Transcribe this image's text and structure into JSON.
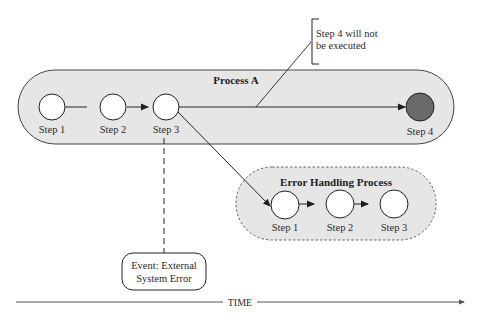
{
  "diagram": {
    "type": "process-flow",
    "colors": {
      "process_fill": "#e6e6e6",
      "process_stroke": "#444444",
      "step_fill": "#ffffff",
      "skipped_step_fill": "#6a6a6a",
      "line": "#222222"
    },
    "process_a": {
      "title": "Process A",
      "steps": [
        {
          "label": "Step 1"
        },
        {
          "label": "Step 2"
        },
        {
          "label": "Step 3"
        },
        {
          "label": "Step 4",
          "state": "not-executed"
        }
      ]
    },
    "error_process": {
      "title": "Error Handling Process",
      "border": "dashed",
      "steps": [
        {
          "label": "Step 1"
        },
        {
          "label": "Step 2"
        },
        {
          "label": "Step 3"
        }
      ]
    },
    "callout": {
      "line1": "Step 4 will not",
      "line2": "be executed"
    },
    "event": {
      "line1": "Event: External",
      "line2": "System Error"
    },
    "time_axis": {
      "label": "TIME"
    }
  }
}
